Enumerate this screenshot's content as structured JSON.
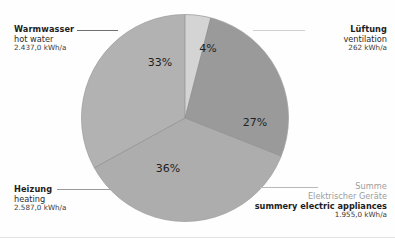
{
  "chart_data": {
    "type": "pie",
    "title": "",
    "unit": "kWh/a",
    "categories": [
      "Warmwasser",
      "Lüftung",
      "Summe Elektrischer Geräte",
      "Heizung"
    ],
    "categories_en": [
      "hot water",
      "ventilation",
      "summery electric appliances",
      "heating"
    ],
    "values": [
      2437.0,
      262,
      1955.0,
      2587.0
    ],
    "values_text": [
      "2.437,0 kWh/a",
      "262 kWh/a",
      "1.955,0 kWh/a",
      "2.587,0 kWh/a"
    ],
    "percentages": [
      33,
      4,
      27,
      36
    ],
    "percent_labels": [
      "33%",
      "4%",
      "27%",
      "36%"
    ],
    "colors": [
      "#b2b2b2",
      "#d4d4d4",
      "#9a9a9a",
      "#adadad"
    ],
    "legend_position": "callout-corners",
    "grid": false
  },
  "slices": {
    "hot_water": {
      "de": "Warmwasser",
      "en": "hot water",
      "value": "2.437,0 kWh/a",
      "percent": "33%",
      "color": "#b2b2b2"
    },
    "ventilation": {
      "de": "Lüftung",
      "en": "ventilation",
      "value": "262 kWh/a",
      "percent": "4%",
      "color": "#d4d4d4"
    },
    "appliances": {
      "de_line1": "Summe",
      "de_line2": "Elektrischer Geräte",
      "en": "summery electric appliances",
      "value": "1.955,0 kWh/a",
      "percent": "27%",
      "color": "#9a9a9a"
    },
    "heating": {
      "de": "Heizung",
      "en": "heating",
      "value": "2.587,0 kWh/a",
      "percent": "36%",
      "color": "#adadad"
    }
  }
}
